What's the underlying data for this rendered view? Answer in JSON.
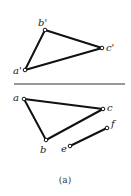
{
  "diagram": {
    "caption": "(a)",
    "upper_view": {
      "points": [
        {
          "id": "a1",
          "label": "a'",
          "x": 25,
          "y": 70
        },
        {
          "id": "b1",
          "label": "b'",
          "x": 45,
          "y": 30
        },
        {
          "id": "c1",
          "label": "c'",
          "x": 102,
          "y": 48
        }
      ],
      "edges": [
        [
          "a1",
          "b1"
        ],
        [
          "b1",
          "c1"
        ],
        [
          "c1",
          "a1"
        ]
      ]
    },
    "projection_axis": {
      "x1": 14,
      "y1": 84,
      "x2": 125,
      "y2": 84
    },
    "lower_view": {
      "points": [
        {
          "id": "a",
          "label": "a",
          "x": 24,
          "y": 99
        },
        {
          "id": "b",
          "label": "b",
          "x": 46,
          "y": 140
        },
        {
          "id": "c",
          "label": "c",
          "x": 103,
          "y": 109
        },
        {
          "id": "e",
          "label": "e",
          "x": 70,
          "y": 146
        },
        {
          "id": "f",
          "label": "f",
          "x": 107,
          "y": 128
        }
      ],
      "edges": [
        [
          "a",
          "b"
        ],
        [
          "b",
          "c"
        ],
        [
          "c",
          "a"
        ],
        [
          "e",
          "f"
        ]
      ]
    },
    "labels": {
      "a_prime": "a'",
      "b_prime": "b'",
      "c_prime": "c'",
      "a": "a",
      "b": "b",
      "c": "c",
      "e": "e",
      "f": "f"
    }
  }
}
